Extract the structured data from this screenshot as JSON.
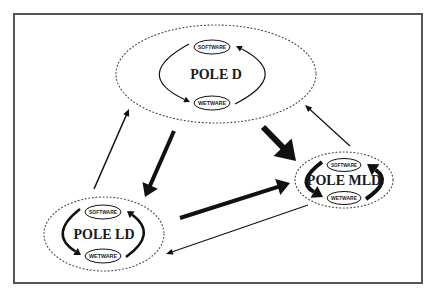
{
  "diagram": {
    "frame": {
      "x": 14,
      "y": 14,
      "width": 408,
      "height": 269,
      "stroke": "#555555"
    },
    "colors": {
      "ink": "#111111",
      "background": "#ffffff",
      "dotted_border": "#444444"
    },
    "poles": [
      {
        "id": "pole-d",
        "label": "POLE D",
        "cx": 216,
        "cy": 74,
        "rx": 100,
        "ry": 49,
        "title_size": 14,
        "software": {
          "label": "SOFTWARE",
          "cx": 212,
          "cy": 47,
          "rx": 18,
          "ry": 7
        },
        "wetware": {
          "label": "WETWARE",
          "cx": 212,
          "cy": 103,
          "rx": 18,
          "ry": 7
        },
        "cycle_stroke": 1.2
      },
      {
        "id": "pole-ld",
        "label": "POLE LD",
        "cx": 104,
        "cy": 234,
        "rx": 60,
        "ry": 37,
        "title_size": 14,
        "software": {
          "label": "SOFTWARE",
          "cx": 103,
          "cy": 212,
          "rx": 18,
          "ry": 7
        },
        "wetware": {
          "label": "WETWARE",
          "cx": 103,
          "cy": 256,
          "rx": 18,
          "ry": 7
        },
        "cycle_stroke": 2.5
      },
      {
        "id": "pole-mld",
        "label": "POLE MLD",
        "cx": 344,
        "cy": 180,
        "rx": 49,
        "ry": 28,
        "title_size": 14,
        "software": {
          "label": "SOFTWARE",
          "cx": 344,
          "cy": 165,
          "rx": 17,
          "ry": 6.5
        },
        "wetware": {
          "label": "WETWARE",
          "cx": 344,
          "cy": 198,
          "rx": 17,
          "ry": 6.5
        },
        "cycle_stroke": 4
      }
    ],
    "flows": [
      {
        "from": "POLE LD",
        "to": "POLE D",
        "weight": "thin",
        "x1": 94,
        "y1": 189,
        "x2": 129,
        "y2": 109,
        "stroke": 1.5
      },
      {
        "from": "POLE D",
        "to": "POLE LD",
        "weight": "thick",
        "x1": 174,
        "y1": 131,
        "x2": 145,
        "y2": 197,
        "stroke": 4
      },
      {
        "from": "POLE D",
        "to": "POLE MLD",
        "weight": "very-thick",
        "x1": 263,
        "y1": 127,
        "x2": 296,
        "y2": 161,
        "stroke": 6
      },
      {
        "from": "POLE MLD",
        "to": "POLE D",
        "weight": "thin",
        "x1": 350,
        "y1": 146,
        "x2": 305,
        "y2": 105,
        "stroke": 1.2
      },
      {
        "from": "POLE LD",
        "to": "POLE MLD",
        "weight": "thick",
        "x1": 180,
        "y1": 218,
        "x2": 290,
        "y2": 183,
        "stroke": 4
      },
      {
        "from": "POLE MLD",
        "to": "POLE LD",
        "weight": "thin",
        "x1": 308,
        "y1": 205,
        "x2": 166,
        "y2": 254,
        "stroke": 1.2
      }
    ]
  }
}
